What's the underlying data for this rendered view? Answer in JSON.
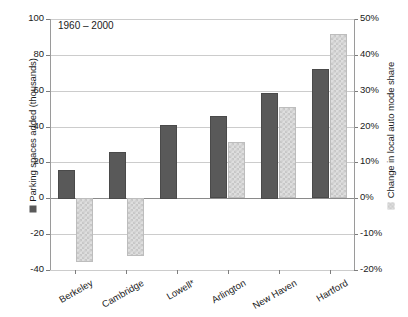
{
  "chart_data": {
    "type": "bar",
    "title": "",
    "annotation": "1960 – 2000",
    "categories": [
      "Berkeley",
      "Cambridge",
      "Lowell*",
      "Arlington",
      "New Haven",
      "Hartford"
    ],
    "series": [
      {
        "name": "Parking spaces added (thousands)",
        "axis": "left",
        "color": "#595959",
        "values": [
          16,
          26,
          41,
          46,
          59,
          72
        ]
      },
      {
        "name": "Change in local auto mode share",
        "axis": "right",
        "color": "#dedede",
        "values": [
          -17.8,
          -16.2,
          0,
          15.6,
          25.4,
          45.7
        ]
      }
    ],
    "ylabel_left": "Parking spaces added (thousands)",
    "ylabel_right": "Change in local auto mode share",
    "xlabel": "",
    "ylim_left": [
      -40,
      100
    ],
    "ylim_right": [
      -20,
      50
    ],
    "yticks_left": [
      100,
      80,
      60,
      40,
      20,
      0,
      -20,
      -40
    ],
    "yticks_left_labels": [
      "100",
      "80",
      "60",
      "40",
      "20",
      "0",
      "-20",
      "-40"
    ],
    "yticks_right": [
      50,
      40,
      30,
      20,
      10,
      0,
      -10,
      -20
    ],
    "yticks_right_labels": [
      "50%",
      "40%",
      "30%",
      "20%",
      "10%",
      "0%",
      "-10%",
      "-20%"
    ],
    "grid": true,
    "legend_position": "axis-titles"
  },
  "legend": {
    "dark_label": "Parking spaces added (thousands)",
    "light_label": "Change in local auto mode share"
  }
}
